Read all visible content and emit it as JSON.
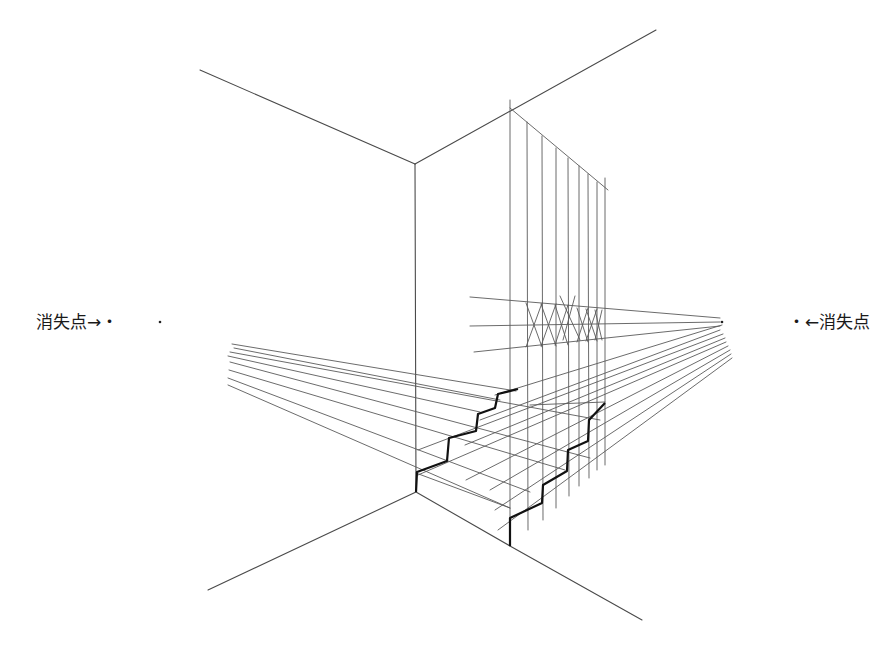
{
  "labels": {
    "vanishing_point_left": "消失点→・",
    "vanishing_point_right": "・←消失点"
  },
  "drawing": {
    "subject": "Two-point perspective construction of a staircase in a room corner",
    "stroke_color": "#5a5a5a",
    "bold_stroke_color": "#111111",
    "background": "#ffffff",
    "vanishing_points": {
      "left": {
        "x": 160,
        "y": 322
      },
      "right": {
        "x": 722,
        "y": 322
      }
    }
  }
}
